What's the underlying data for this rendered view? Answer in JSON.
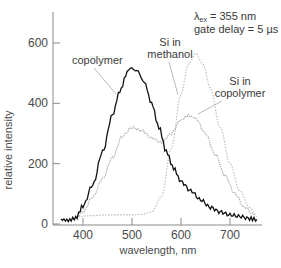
{
  "chart_data": {
    "type": "line",
    "title": "",
    "xlabel": "wavelength, nm",
    "ylabel": "relative intensity",
    "xlim": [
      350,
      770
    ],
    "ylim": [
      0,
      650
    ],
    "x_ticks": [
      400,
      500,
      600,
      700
    ],
    "y_ticks": [
      0,
      200,
      400,
      600
    ],
    "grid": false,
    "legend": "inline annotations",
    "annotations": {
      "conditions_line1": "λex = 355 nm",
      "conditions_line2": "gate delay = 5 µs",
      "copolymer": "copolymer",
      "si_methanol_line1": "Si in",
      "si_methanol_line2": "methanol",
      "si_copolymer_line1": "Si in",
      "si_copolymer_line2": "copolymer"
    },
    "series": [
      {
        "name": "copolymer",
        "style": "solid black, noisy",
        "color": "#111111",
        "x": [
          355,
          370,
          385,
          400,
          420,
          440,
          460,
          475,
          490,
          500,
          510,
          525,
          540,
          555,
          570,
          585,
          600,
          620,
          640,
          660,
          680,
          700,
          720,
          740,
          755
        ],
        "y": [
          15,
          12,
          20,
          60,
          130,
          240,
          360,
          440,
          500,
          520,
          510,
          470,
          400,
          320,
          240,
          185,
          140,
          110,
          80,
          55,
          40,
          30,
          25,
          18,
          15
        ]
      },
      {
        "name": "Si in methanol",
        "style": "light grey dotted",
        "color": "#b8b8b8",
        "x": [
          390,
          420,
          450,
          480,
          500,
          520,
          540,
          560,
          580,
          600,
          615,
          630,
          645,
          660,
          680,
          700,
          720,
          740,
          755
        ],
        "y": [
          25,
          28,
          30,
          30,
          30,
          32,
          40,
          90,
          250,
          430,
          530,
          565,
          530,
          450,
          320,
          200,
          110,
          55,
          25
        ]
      },
      {
        "name": "Si in copolymer",
        "style": "grey dotted, noisy",
        "color": "#a0a0a0",
        "x": [
          380,
          400,
          420,
          440,
          460,
          480,
          500,
          520,
          540,
          560,
          580,
          600,
          615,
          630,
          650,
          670,
          690,
          710,
          730,
          750
        ],
        "y": [
          15,
          40,
          90,
          150,
          220,
          290,
          320,
          310,
          285,
          270,
          300,
          345,
          360,
          350,
          300,
          230,
          160,
          100,
          55,
          30
        ]
      }
    ]
  }
}
